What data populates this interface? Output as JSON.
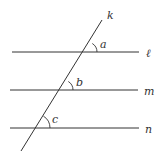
{
  "diagram": {
    "transversal": {
      "label": "k",
      "x1": 21,
      "y1": 151,
      "x2": 102,
      "y2": 20,
      "label_x": 107,
      "label_y": 19
    },
    "lines": [
      {
        "label": "ℓ",
        "y": 52,
        "x1": 12,
        "x2": 139,
        "label_x": 146,
        "label_y": 57
      },
      {
        "label": "m",
        "y": 90,
        "x1": 10,
        "x2": 138,
        "label_x": 144,
        "label_y": 95
      },
      {
        "label": "n",
        "y": 128,
        "x1": 10,
        "x2": 139,
        "label_x": 145,
        "label_y": 133
      }
    ],
    "angles": [
      {
        "label": "a",
        "cx": 87,
        "cy": 52,
        "label_x": 100,
        "label_y": 47
      },
      {
        "label": "b",
        "cx": 63,
        "cy": 90,
        "label_x": 76,
        "label_y": 85
      },
      {
        "label": "c",
        "cx": 36,
        "cy": 128,
        "label_x": 52,
        "label_y": 123
      }
    ],
    "stroke_color": "#333333"
  }
}
